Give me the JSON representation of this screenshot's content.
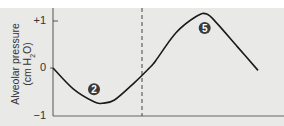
{
  "chart_data": {
    "type": "line",
    "title": "",
    "xlabel": "",
    "ylabel": "Alveolar pressure (cm H2O)",
    "ylabel_line1": "Alveolar pressure",
    "ylabel_line2_prefix": "(cm H",
    "ylabel_line2_sub": "2",
    "ylabel_line2_suffix": "O)",
    "ylim": [
      -1,
      1.3
    ],
    "yticks": [
      "+1",
      "0",
      "−1"
    ],
    "ytick_values": [
      1,
      0,
      -1
    ],
    "grid": false,
    "series": [
      {
        "name": "Alveolar pressure",
        "x": [
          0,
          0.1,
          0.2,
          0.24,
          0.3,
          0.4,
          0.47,
          0.5,
          0.6,
          0.7,
          0.75,
          0.8,
          0.9,
          1.0
        ],
        "values": [
          0,
          -0.45,
          -0.72,
          -0.75,
          -0.68,
          -0.3,
          0,
          0.15,
          0.75,
          1.1,
          1.15,
          0.95,
          0.45,
          -0.05
        ]
      }
    ],
    "vertical_divider_x": 0.47,
    "annotations": [
      {
        "label": "2",
        "x": 0.2,
        "y": -0.45
      },
      {
        "label": "5",
        "x": 0.74,
        "y": 0.85
      }
    ]
  },
  "colors": {
    "background": "#e9e9e8",
    "curve": "#1a1a1a",
    "marker_fill": "#3a3a3a",
    "marker_text": "#ffffff",
    "axis": "#555555"
  }
}
